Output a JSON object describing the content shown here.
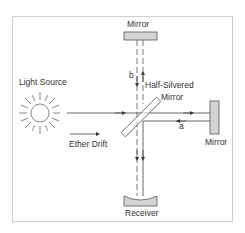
{
  "labels": {
    "top_mirror": "Mirror",
    "light_source": "Light Source",
    "half_silvered": "Half-Silvered",
    "half_silvered_2": "Mirror",
    "right_mirror": "Mirror",
    "ether_drift": "Ether Drift",
    "receiver": "Receiver",
    "path_a": "a",
    "path_b": "b"
  },
  "colors": {
    "line": "#444444",
    "mirror_fill": "#d4d4d4",
    "frame": "#cfcfcf"
  }
}
